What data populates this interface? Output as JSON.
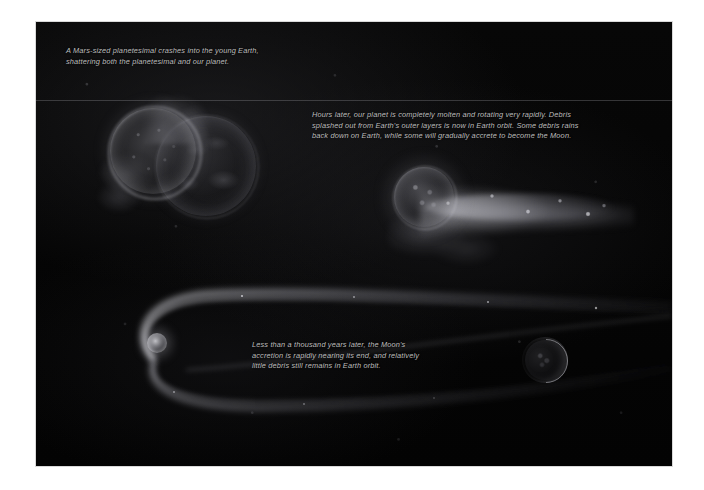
{
  "figure": {
    "kind": "astronomy-illustration",
    "background_color": "#050505",
    "caption_color": "#bdbdbd",
    "page_background": "#ffffff",
    "panels": [
      {
        "id": "panel-collision",
        "caption": "A Mars-sized planetesimal crashes into the young Earth,\nshattering both the planetesimal and our planet."
      },
      {
        "id": "panel-molten-earth",
        "caption": "Hours later, our planet is completely molten and rotating very rapidly. Debris\nsplashed out from Earth's outer layers is now in Earth orbit. Some debris rains\nback down on Earth, while some will gradually accrete to become the Moon."
      },
      {
        "id": "panel-moon-accretion",
        "caption": "Less than a thousand years later, the Moon's\naccretion is rapidly nearing its end, and relatively\nlittle debris still remains in Earth orbit."
      }
    ],
    "bodies": [
      {
        "name": "planetesimal",
        "label": "Mars-sized planetesimal"
      },
      {
        "name": "young-earth",
        "label": "young Earth"
      },
      {
        "name": "molten-earth",
        "label": "molten Earth"
      },
      {
        "name": "debris-disk",
        "label": "Earth-orbiting debris disk"
      },
      {
        "name": "late-earth",
        "label": "Earth"
      },
      {
        "name": "moon",
        "label": "Moon"
      }
    ]
  }
}
